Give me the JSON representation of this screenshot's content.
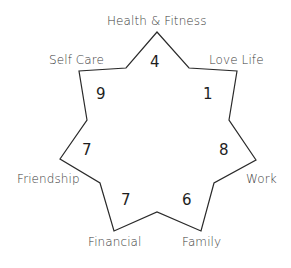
{
  "diagram": {
    "type": "wheel-of-life-star",
    "stroke_color": "#2a2a2a",
    "categories": [
      {
        "label": "Health & Fitness",
        "score": "4"
      },
      {
        "label": "Love Life",
        "score": "1"
      },
      {
        "label": "Work",
        "score": "8"
      },
      {
        "label": "Family",
        "score": "6"
      },
      {
        "label": "Financial",
        "score": "7"
      },
      {
        "label": "Friendship",
        "score": "7"
      },
      {
        "label": "Self Care",
        "score": "9"
      }
    ]
  }
}
